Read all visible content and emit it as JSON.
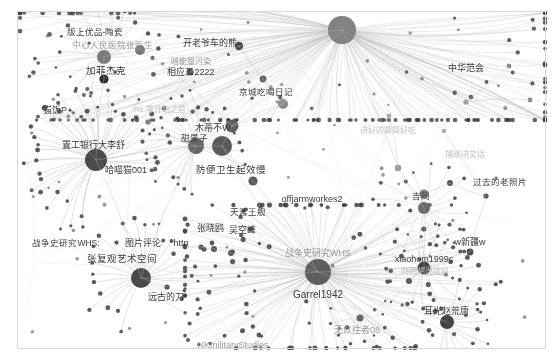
{
  "view": {
    "background": "#ffffff",
    "edge_color": "#b9b9b9",
    "node_color_dark": "#3f3f3f",
    "node_color_mid": "#6f6f6f",
    "node_color_light": "#9c9c9c",
    "border_color": "#d8d8d8",
    "width": 554,
    "height": 360
  },
  "graph": {
    "type": "node-link-network",
    "hubs": [
      {
        "label": "Garrel1942",
        "x": 318,
        "y": 272,
        "r": 13,
        "tone": "dark"
      },
      {
        "label": "战争史研究WHS",
        "x": 318,
        "y": 272,
        "r": 13,
        "tone": "dark"
      },
      {
        "label": "",
        "x": 342,
        "y": 30,
        "r": 14,
        "tone": "mid"
      },
      {
        "label": "哈喵猫001",
        "x": 96,
        "y": 160,
        "r": 11,
        "tone": "dark"
      },
      {
        "label": "张复观艺术空间",
        "x": 141,
        "y": 278,
        "r": 10,
        "tone": "dark"
      },
      {
        "label": "甜果子",
        "x": 222,
        "y": 146,
        "r": 10,
        "tone": "dark"
      },
      {
        "label": "耳光赵荒唐",
        "x": 447,
        "y": 322,
        "r": 7,
        "tone": "dark"
      },
      {
        "label": "xiaohom1999c",
        "x": 424,
        "y": 268,
        "r": 7,
        "tone": "dark"
      },
      {
        "label": "吉同",
        "x": 424,
        "y": 208,
        "r": 6,
        "tone": "mid"
      },
      {
        "label": "加菲杰克",
        "x": 104,
        "y": 57,
        "r": 7,
        "tone": "mid"
      },
      {
        "label": "无以往者08",
        "x": 318,
        "y": 272,
        "r": 0,
        "tone": "mid"
      }
    ],
    "labels": [
      {
        "text": "版上优品-陶瓷",
        "x": 95,
        "y": 32,
        "size": 8.5,
        "tone": "dark"
      },
      {
        "text": "中心人民医院张医生",
        "x": 112,
        "y": 45,
        "size": 8.5,
        "tone": "dim"
      },
      {
        "text": "开老爷车的熊",
        "x": 210,
        "y": 43,
        "size": 9,
        "tone": "dark"
      },
      {
        "text": "暗能量污染",
        "x": 191,
        "y": 62,
        "size": 8,
        "tone": "dim"
      },
      {
        "text": "相应工2222",
        "x": 191,
        "y": 72,
        "size": 9,
        "tone": "dark"
      },
      {
        "text": "加菲杰克",
        "x": 106,
        "y": 71,
        "size": 9.5,
        "tone": "dark"
      },
      {
        "text": "猫饭P",
        "x": 55,
        "y": 110,
        "size": 9,
        "tone": "dark"
      },
      {
        "text": "Re:零开始之音",
        "x": 160,
        "y": 110,
        "size": 8,
        "tone": "vdim"
      },
      {
        "text": "京城吃喝日记",
        "x": 266,
        "y": 92,
        "size": 8.5,
        "tone": "dark"
      },
      {
        "text": "置工银行大李舒",
        "x": 93,
        "y": 145,
        "size": 9,
        "tone": "dark"
      },
      {
        "text": "哈喵猫001",
        "x": 126,
        "y": 170,
        "size": 9,
        "tone": "dark"
      },
      {
        "text": "木蒂不W",
        "x": 213,
        "y": 128,
        "size": 9,
        "tone": "dark"
      },
      {
        "text": "甜果子",
        "x": 194,
        "y": 138,
        "size": 8.5,
        "tone": "dark"
      },
      {
        "text": "防便卫生起效慢",
        "x": 231,
        "y": 170,
        "size": 9.5,
        "tone": "dark"
      },
      {
        "text": "讲好的简简好吃",
        "x": 388,
        "y": 131,
        "size": 8,
        "tone": "vdim"
      },
      {
        "text": "中华范会",
        "x": 466,
        "y": 68,
        "size": 9,
        "tone": "dark"
      },
      {
        "text": "捕刚讲笑话",
        "x": 465,
        "y": 155,
        "size": 8,
        "tone": "vdim"
      },
      {
        "text": "过去的老照片",
        "x": 500,
        "y": 182,
        "size": 8.5,
        "tone": "dark"
      },
      {
        "text": "吉同",
        "x": 421,
        "y": 196,
        "size": 8.5,
        "tone": "dark"
      },
      {
        "text": "offjarmworkes2",
        "x": 312,
        "y": 199,
        "size": 9,
        "tone": "dark"
      },
      {
        "text": "天渡王舰",
        "x": 248,
        "y": 212,
        "size": 8.5,
        "tone": "dark"
      },
      {
        "text": "张晓鸥",
        "x": 210,
        "y": 228,
        "size": 9,
        "tone": "dark"
      },
      {
        "text": "吴空峰",
        "x": 242,
        "y": 230,
        "size": 9,
        "tone": "dark"
      },
      {
        "text": "w新疆w",
        "x": 470,
        "y": 242,
        "size": 9,
        "tone": "dark"
      },
      {
        "text": "xiaohom1999c",
        "x": 424,
        "y": 259,
        "size": 9,
        "tone": "dark"
      },
      {
        "text": "刘湘胡逸雄级",
        "x": 425,
        "y": 272,
        "size": 8,
        "tone": "vdim"
      },
      {
        "text": "战争史研究WHS:",
        "x": 66,
        "y": 243,
        "size": 8.5,
        "tone": "dark"
      },
      {
        "text": "图片评论",
        "x": 143,
        "y": 243,
        "size": 9,
        "tone": "dark"
      },
      {
        "text": "http",
        "x": 181,
        "y": 243,
        "size": 9,
        "tone": "dark"
      },
      {
        "text": "张复观艺术空间",
        "x": 122,
        "y": 259,
        "size": 9.5,
        "tone": "dark"
      },
      {
        "text": "战争史研究WHS",
        "x": 318,
        "y": 253,
        "size": 9,
        "tone": "dim"
      },
      {
        "text": "Garrel1942",
        "x": 318,
        "y": 295,
        "size": 10,
        "tone": "dark"
      },
      {
        "text": "远古的刀",
        "x": 166,
        "y": 297,
        "size": 9,
        "tone": "dark"
      },
      {
        "text": "无以往者08",
        "x": 357,
        "y": 330,
        "size": 9,
        "tone": "dim"
      },
      {
        "text": "耳光赵荒唐",
        "x": 446,
        "y": 311,
        "size": 9,
        "tone": "dark"
      },
      {
        "text": "NKmilitaryStudies",
        "x": 233,
        "y": 345,
        "size": 9,
        "tone": "dim"
      }
    ]
  }
}
